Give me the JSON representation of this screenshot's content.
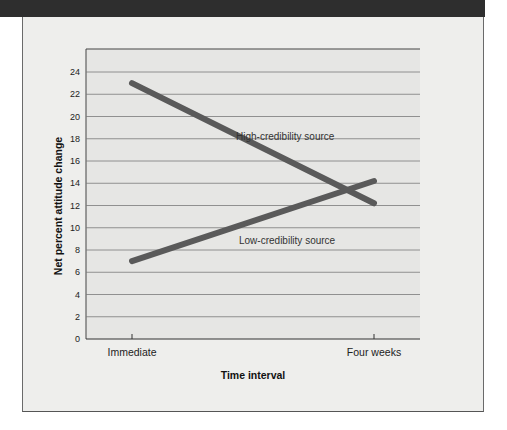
{
  "chart_data": {
    "type": "line",
    "title": "",
    "xlabel": "Time interval",
    "ylabel": "Net percent attitude change",
    "categories": [
      "Immediate",
      "Four weeks"
    ],
    "ylim": [
      0,
      26
    ],
    "yticks": [
      0,
      2,
      4,
      6,
      8,
      10,
      12,
      14,
      16,
      18,
      20,
      22,
      24
    ],
    "grid": true,
    "legend": "inline labels",
    "series": [
      {
        "name": "High-credibility source",
        "values": [
          23,
          12.2
        ],
        "color": "#5a5a5a"
      },
      {
        "name": "Low-credibility source",
        "values": [
          7,
          14.2
        ],
        "color": "#5a5a5a"
      }
    ]
  },
  "colors": {
    "plot_bg": "#e6e6e4",
    "gridline": "#7a7a7a",
    "line": "#5a5a5a",
    "header_band": "#2e2e2e"
  }
}
